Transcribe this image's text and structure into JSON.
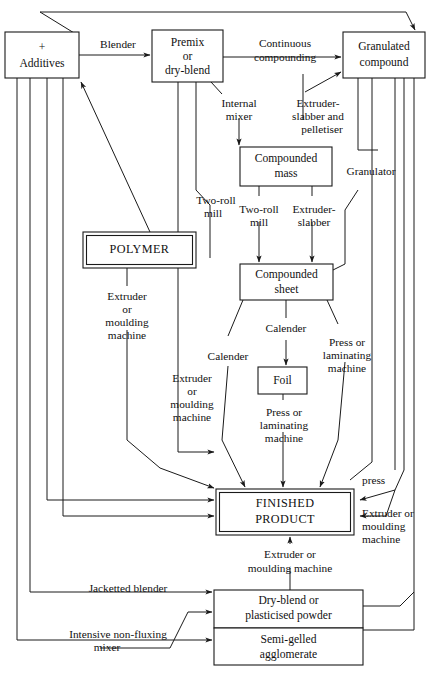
{
  "diagram": {
    "type": "flowchart",
    "width": 434,
    "height": 675,
    "stroke_color": "#1a1a1a",
    "background_color": "#ffffff"
  },
  "boxes": [
    {
      "id": "additives",
      "lines": [
        "+",
        "Additives"
      ],
      "style": "single",
      "x": 5,
      "y": 32,
      "w": 74,
      "h": 46
    },
    {
      "id": "premix",
      "lines": [
        "Premix",
        "or",
        "dry-blend"
      ],
      "style": "single",
      "x": 152,
      "y": 30,
      "w": 71,
      "h": 52
    },
    {
      "id": "granulated",
      "lines": [
        "Granulated",
        "compound"
      ],
      "style": "single",
      "x": 343,
      "y": 32,
      "w": 82,
      "h": 46
    },
    {
      "id": "cmass",
      "lines": [
        "Compounded",
        "mass"
      ],
      "style": "single",
      "x": 240,
      "y": 147,
      "w": 92,
      "h": 39
    },
    {
      "id": "polymer",
      "lines": [
        "POLYMER"
      ],
      "style": "double",
      "x": 83,
      "y": 232,
      "w": 113,
      "h": 36
    },
    {
      "id": "csheet",
      "lines": [
        "Compounded",
        "sheet"
      ],
      "style": "single",
      "x": 240,
      "y": 264,
      "w": 93,
      "h": 36
    },
    {
      "id": "foil",
      "lines": [
        "Foil"
      ],
      "style": "single",
      "x": 258,
      "y": 367,
      "w": 49,
      "h": 27
    },
    {
      "id": "finished",
      "lines": [
        "FINISHED",
        "PRODUCT"
      ],
      "style": "double",
      "x": 216,
      "y": 489,
      "w": 138,
      "h": 46
    },
    {
      "id": "dryblend",
      "lines": [
        "Dry-blend or",
        "plasticised powder"
      ],
      "style": "single",
      "x": 214,
      "y": 590,
      "w": 149,
      "h": 38
    },
    {
      "id": "semigelled",
      "lines": [
        "Semi-gelled",
        "agglomerate"
      ],
      "style": "single",
      "x": 214,
      "y": 628,
      "w": 149,
      "h": 37
    }
  ],
  "edge_labels": [
    {
      "id": "blender",
      "lines": [
        "Blender"
      ],
      "x": 118,
      "y": 45,
      "align": "middle"
    },
    {
      "id": "continuous",
      "lines": [
        "Continuous",
        "compounding"
      ],
      "x": 285,
      "y": 44,
      "align": "middle"
    },
    {
      "id": "internal-mixer",
      "lines": [
        "Internal",
        "mixer"
      ],
      "x": 239,
      "y": 104,
      "align": "middle"
    },
    {
      "id": "extruder-slabber-pelletiser",
      "lines": [
        "Extruder-",
        "slabber and",
        "pelletiser"
      ],
      "x": 318,
      "y": 104,
      "align": "middle"
    },
    {
      "id": "granulator",
      "lines": [
        "Granulator"
      ],
      "x": 370,
      "y": 172,
      "align": "middle"
    },
    {
      "id": "two-roll-mill-1",
      "lines": [
        "Two-roll",
        "mill"
      ],
      "x": 216,
      "y": 201,
      "align": "middle"
    },
    {
      "id": "two-roll-mill-2",
      "lines": [
        "Two-roll",
        "mill"
      ],
      "x": 259,
      "y": 210,
      "align": "middle"
    },
    {
      "id": "extruder-slabber",
      "lines": [
        "Extruder-",
        "slabber"
      ],
      "x": 312,
      "y": 210,
      "align": "middle"
    },
    {
      "id": "extruder-moulding-1",
      "lines": [
        "Extruder",
        "or",
        "moulding",
        "machine"
      ],
      "x": 127,
      "y": 302,
      "align": "middle"
    },
    {
      "id": "calender-1",
      "lines": [
        "Calender"
      ],
      "x": 286,
      "y": 329,
      "align": "middle"
    },
    {
      "id": "press-laminating-1",
      "lines": [
        "Press or",
        "laminating",
        "machine"
      ],
      "x": 347,
      "y": 343,
      "align": "middle"
    },
    {
      "id": "calender-2",
      "lines": [
        "Calender"
      ],
      "x": 228,
      "y": 357,
      "align": "middle"
    },
    {
      "id": "extruder-moulding-2",
      "lines": [
        "Extruder",
        "or",
        "moulding",
        "machine"
      ],
      "x": 192,
      "y": 379,
      "align": "middle"
    },
    {
      "id": "press-laminating-2",
      "lines": [
        "Press or",
        "laminating",
        "machine"
      ],
      "x": 284,
      "y": 413,
      "align": "middle"
    },
    {
      "id": "press",
      "lines": [
        "press"
      ],
      "x": 376,
      "y": 481,
      "align": "middle"
    },
    {
      "id": "extruder-moulding-3",
      "lines": [
        "Extruder or",
        "moulding",
        "machine"
      ],
      "x": 392,
      "y": 514,
      "align": "middle"
    },
    {
      "id": "extruder-moulding-4",
      "lines": [
        "Extruder or",
        "moulding machine"
      ],
      "x": 290,
      "y": 555,
      "align": "middle"
    },
    {
      "id": "jacketted-blender",
      "lines": [
        "Jacketted blender"
      ],
      "x": 128,
      "y": 591,
      "align": "middle"
    },
    {
      "id": "intensive-mixer",
      "lines": [
        "Intensive non-fluxing",
        "mixer"
      ],
      "x": 118,
      "y": 639,
      "align": "middle"
    }
  ]
}
